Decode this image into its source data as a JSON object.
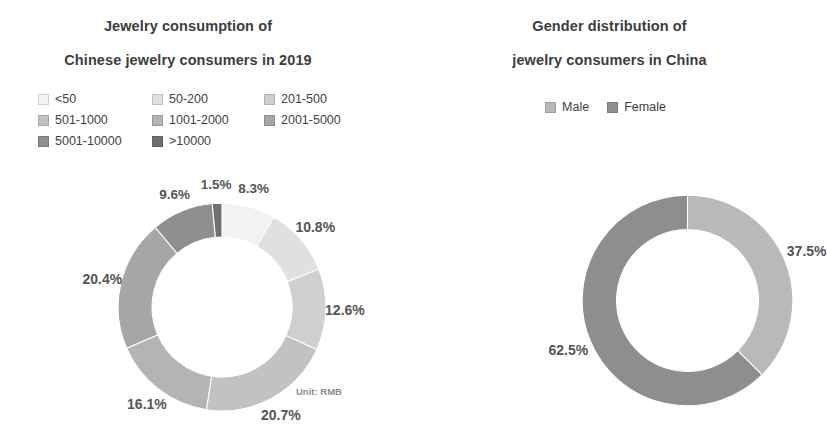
{
  "charts": {
    "left": {
      "title_line1": "Jewelry consumption of",
      "title_line2": "Chinese jewelry consumers in 2019",
      "unit_note": "Unit: RMB"
    },
    "right": {
      "title_line1": "Gender distribution of",
      "title_line2": "jewelry consumers in China"
    }
  },
  "chart_data": [
    {
      "type": "pie",
      "variant": "donut",
      "id": "jewelry-consumption",
      "title": "Jewelry consumption of Chinese jewelry consumers in 2019",
      "unit": "Unit: RMB",
      "legend_position": "top",
      "start_angle_deg": 0,
      "direction": "clockwise",
      "categories": [
        "<50",
        "50-200",
        "201-500",
        "501-1000",
        "1001-2000",
        "2001-5000",
        "5001-10000",
        ">10000"
      ],
      "values": [
        8.3,
        10.8,
        12.6,
        20.7,
        16.1,
        20.4,
        9.6,
        1.5
      ],
      "labels": [
        "8.3%",
        "10.8%",
        "12.6%",
        "20.7%",
        "16.1%",
        "20.4%",
        "9.6%",
        "1.5%"
      ],
      "colors": [
        "#f2f2f2",
        "#e0e0e0",
        "#cfcfcf",
        "#c2c2c2",
        "#b4b4b4",
        "#a6a6a6",
        "#8f8f8f",
        "#707070"
      ],
      "total": 100.0
    },
    {
      "type": "pie",
      "variant": "donut",
      "id": "gender-distribution",
      "title": "Gender distribution of jewelry consumers in China",
      "legend_position": "top",
      "start_angle_deg": 0,
      "direction": "clockwise",
      "categories": [
        "Male",
        "Female"
      ],
      "values": [
        37.5,
        62.5
      ],
      "labels": [
        "37.5%",
        "62.5%"
      ],
      "colors": [
        "#b9b9b9",
        "#8e8e8e"
      ],
      "total": 100.0
    }
  ]
}
